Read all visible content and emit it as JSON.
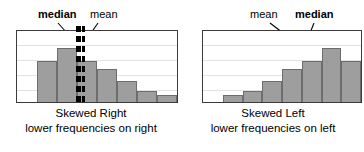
{
  "figure": {
    "background": "#ffffff",
    "bar_fill": "#9e9e9e",
    "bar_stroke": "#6d6d6d",
    "grid_color": "#e2e2e2",
    "frame_color": "#3b3b3b",
    "line_color": "#000000"
  },
  "panels": [
    {
      "id": "skewed-right",
      "annotations": {
        "median_label": "median",
        "mean_label": "mean",
        "median_first": true
      },
      "caption": {
        "line1": "Skewed Right",
        "line2": "lower frequencies on right"
      },
      "chart_data": {
        "type": "bar",
        "title": "Skewed Right",
        "subtitle": "lower frequencies on right",
        "xlabel": "",
        "ylabel": "",
        "categories": [
          "1",
          "2",
          "3",
          "4",
          "5",
          "6",
          "7",
          "8"
        ],
        "values": [
          0,
          58,
          76,
          58,
          46,
          30,
          16,
          10
        ],
        "ylim": [
          0,
          100
        ],
        "grid": true,
        "gridlines": [
          20,
          40,
          60,
          80
        ],
        "legend": "none",
        "annotations": [
          {
            "label": "median",
            "type": "vline-thick",
            "x_category_index": 3
          },
          {
            "label": "mean",
            "type": "vline-thin",
            "x_category_index": 3
          }
        ]
      }
    },
    {
      "id": "skewed-left",
      "annotations": {
        "median_label": "median",
        "mean_label": "mean",
        "median_first": false
      },
      "caption": {
        "line1": "Skewed Left",
        "line2": "lower frequencies on left"
      },
      "chart_data": {
        "type": "bar",
        "title": "Skewed Left",
        "subtitle": "lower frequencies on left",
        "xlabel": "",
        "ylabel": "",
        "categories": [
          "1",
          "2",
          "3",
          "4",
          "5",
          "6",
          "7",
          "8"
        ],
        "values": [
          0,
          10,
          16,
          30,
          46,
          58,
          76,
          58
        ],
        "ylim": [
          0,
          100
        ],
        "grid": true,
        "gridlines": [
          20,
          40,
          60,
          80
        ],
        "legend": "none",
        "annotations": [
          {
            "label": "mean",
            "type": "vline-thin",
            "x_category_index": 5
          },
          {
            "label": "median",
            "type": "vline-thick",
            "x_category_index": 5
          }
        ]
      }
    }
  ]
}
